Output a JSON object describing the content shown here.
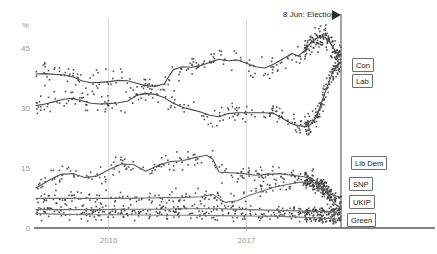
{
  "chart_data": {
    "type": "scatter",
    "title": "",
    "subtitle": "",
    "xlabel": "",
    "ylabel": "%",
    "ylim": [
      0,
      52
    ],
    "yticks": [
      0,
      15,
      30,
      45
    ],
    "ytick_labels": [
      "0",
      "15",
      "30",
      "45"
    ],
    "xlim": [
      "2015-05",
      "2017-08"
    ],
    "xticks": [
      "2016",
      "2017"
    ],
    "xtick_labels": [
      "2016",
      "2017"
    ],
    "grid": "vertical-only",
    "legend_position": "right",
    "annotations": [
      {
        "label": "8 Jun: Election",
        "x": "2017-06-08",
        "marker": "flag-triangle"
      }
    ],
    "series": [
      {
        "name": "Con",
        "color": "#4a4a4a",
        "trend": [
          [
            0.0,
            38.5
          ],
          [
            0.03,
            38.6
          ],
          [
            0.06,
            38.4
          ],
          [
            0.09,
            38.3
          ],
          [
            0.12,
            37.8
          ],
          [
            0.15,
            36.8
          ],
          [
            0.18,
            36.3
          ],
          [
            0.21,
            36.4
          ],
          [
            0.24,
            36.6
          ],
          [
            0.27,
            36.9
          ],
          [
            0.3,
            36.8
          ],
          [
            0.33,
            36.2
          ],
          [
            0.36,
            35.6
          ],
          [
            0.39,
            35.4
          ],
          [
            0.42,
            36.0
          ],
          [
            0.45,
            39.6
          ],
          [
            0.48,
            40.3
          ],
          [
            0.51,
            40.2
          ],
          [
            0.54,
            40.6
          ],
          [
            0.57,
            41.4
          ],
          [
            0.6,
            42.2
          ],
          [
            0.63,
            41.8
          ],
          [
            0.66,
            42.0
          ],
          [
            0.69,
            41.2
          ],
          [
            0.72,
            40.3
          ],
          [
            0.75,
            40.0
          ],
          [
            0.78,
            41.0
          ],
          [
            0.81,
            42.3
          ],
          [
            0.84,
            43.6
          ],
          [
            0.86,
            43.0
          ],
          [
            0.88,
            44.3
          ],
          [
            0.9,
            46.2
          ],
          [
            0.92,
            47.4
          ],
          [
            0.94,
            47.8
          ],
          [
            0.95,
            47.6
          ],
          [
            0.96,
            46.8
          ],
          [
            0.97,
            45.6
          ],
          [
            0.98,
            44.4
          ],
          [
            0.99,
            43.4
          ],
          [
            1.0,
            43.0
          ]
        ]
      },
      {
        "name": "Lab",
        "color": "#4a4a4a",
        "trend": [
          [
            0.0,
            30.6
          ],
          [
            0.03,
            31.0
          ],
          [
            0.06,
            31.6
          ],
          [
            0.09,
            32.2
          ],
          [
            0.12,
            32.4
          ],
          [
            0.15,
            31.8
          ],
          [
            0.18,
            31.2
          ],
          [
            0.21,
            31.0
          ],
          [
            0.24,
            31.1
          ],
          [
            0.27,
            31.3
          ],
          [
            0.3,
            31.7
          ],
          [
            0.33,
            33.2
          ],
          [
            0.36,
            33.6
          ],
          [
            0.39,
            33.4
          ],
          [
            0.42,
            32.6
          ],
          [
            0.45,
            31.2
          ],
          [
            0.48,
            30.2
          ],
          [
            0.51,
            29.6
          ],
          [
            0.54,
            29.0
          ],
          [
            0.57,
            28.2
          ],
          [
            0.6,
            27.8
          ],
          [
            0.63,
            28.6
          ],
          [
            0.66,
            28.8
          ],
          [
            0.69,
            28.8
          ],
          [
            0.72,
            28.8
          ],
          [
            0.75,
            28.8
          ],
          [
            0.78,
            28.6
          ],
          [
            0.81,
            27.3
          ],
          [
            0.84,
            26.0
          ],
          [
            0.86,
            25.6
          ],
          [
            0.88,
            25.4
          ],
          [
            0.9,
            25.8
          ],
          [
            0.92,
            27.8
          ],
          [
            0.93,
            30.0
          ],
          [
            0.94,
            32.2
          ],
          [
            0.95,
            34.4
          ],
          [
            0.96,
            36.4
          ],
          [
            0.97,
            38.4
          ],
          [
            0.98,
            40.0
          ],
          [
            0.99,
            41.0
          ],
          [
            1.0,
            41.4
          ]
        ]
      },
      {
        "name": "Lib Dem",
        "color": "#6f6f6f",
        "trend": [
          [
            0.0,
            7.4
          ],
          [
            0.06,
            7.4
          ],
          [
            0.12,
            7.4
          ],
          [
            0.18,
            7.4
          ],
          [
            0.24,
            7.4
          ],
          [
            0.3,
            7.4
          ],
          [
            0.36,
            7.5
          ],
          [
            0.42,
            7.6
          ],
          [
            0.48,
            7.6
          ],
          [
            0.54,
            7.8
          ],
          [
            0.58,
            8.4
          ],
          [
            0.62,
            6.4
          ],
          [
            0.66,
            6.8
          ],
          [
            0.7,
            8.2
          ],
          [
            0.74,
            9.2
          ],
          [
            0.78,
            10.2
          ],
          [
            0.82,
            10.8
          ],
          [
            0.86,
            11.4
          ],
          [
            0.9,
            11.6
          ],
          [
            0.94,
            10.2
          ],
          [
            0.97,
            8.4
          ],
          [
            1.0,
            7.6
          ]
        ]
      },
      {
        "name": "SNP",
        "color": "#6f6f6f",
        "trend": [
          [
            0.0,
            4.6
          ],
          [
            0.1,
            4.6
          ],
          [
            0.2,
            4.6
          ],
          [
            0.3,
            4.7
          ],
          [
            0.4,
            4.7
          ],
          [
            0.5,
            4.8
          ],
          [
            0.6,
            4.8
          ],
          [
            0.7,
            4.6
          ],
          [
            0.8,
            4.4
          ],
          [
            0.9,
            4.2
          ],
          [
            1.0,
            4.0
          ]
        ]
      },
      {
        "name": "UKIP",
        "color": "#5a5a5a",
        "trend": [
          [
            0.0,
            10.0
          ],
          [
            0.04,
            11.8
          ],
          [
            0.08,
            13.4
          ],
          [
            0.12,
            13.6
          ],
          [
            0.16,
            12.6
          ],
          [
            0.2,
            13.0
          ],
          [
            0.24,
            14.6
          ],
          [
            0.28,
            16.0
          ],
          [
            0.32,
            15.8
          ],
          [
            0.36,
            14.2
          ],
          [
            0.4,
            15.6
          ],
          [
            0.44,
            16.6
          ],
          [
            0.48,
            16.8
          ],
          [
            0.52,
            17.6
          ],
          [
            0.56,
            18.2
          ],
          [
            0.58,
            17.2
          ],
          [
            0.6,
            14.0
          ],
          [
            0.64,
            13.8
          ],
          [
            0.68,
            13.6
          ],
          [
            0.72,
            13.2
          ],
          [
            0.76,
            13.4
          ],
          [
            0.8,
            13.6
          ],
          [
            0.84,
            13.2
          ],
          [
            0.88,
            12.8
          ],
          [
            0.92,
            11.6
          ],
          [
            0.95,
            9.0
          ],
          [
            0.98,
            6.0
          ],
          [
            1.0,
            5.0
          ]
        ]
      },
      {
        "name": "Green",
        "color": "#7a7a7a",
        "trend": [
          [
            0.0,
            3.6
          ],
          [
            0.1,
            3.4
          ],
          [
            0.2,
            3.3
          ],
          [
            0.3,
            3.3
          ],
          [
            0.4,
            3.2
          ],
          [
            0.5,
            3.2
          ],
          [
            0.6,
            3.1
          ],
          [
            0.7,
            3.0
          ],
          [
            0.8,
            2.9
          ],
          [
            0.9,
            2.6
          ],
          [
            1.0,
            2.2
          ]
        ]
      }
    ],
    "scatter_note": "Individual opinion poll results shown as small dots around each party trend line"
  },
  "axis": {
    "unit_label": "%",
    "y_labels": [
      "45",
      "30",
      "15",
      "0"
    ],
    "x_labels": [
      "2016",
      "2017"
    ]
  },
  "annotation": {
    "election_label": "8 Jun: Election"
  },
  "legend": {
    "con": "Con",
    "lab": "Lab",
    "libdem": "Lib Dem",
    "snp": "SNP",
    "ukip": "UKIP",
    "green": "Green"
  }
}
